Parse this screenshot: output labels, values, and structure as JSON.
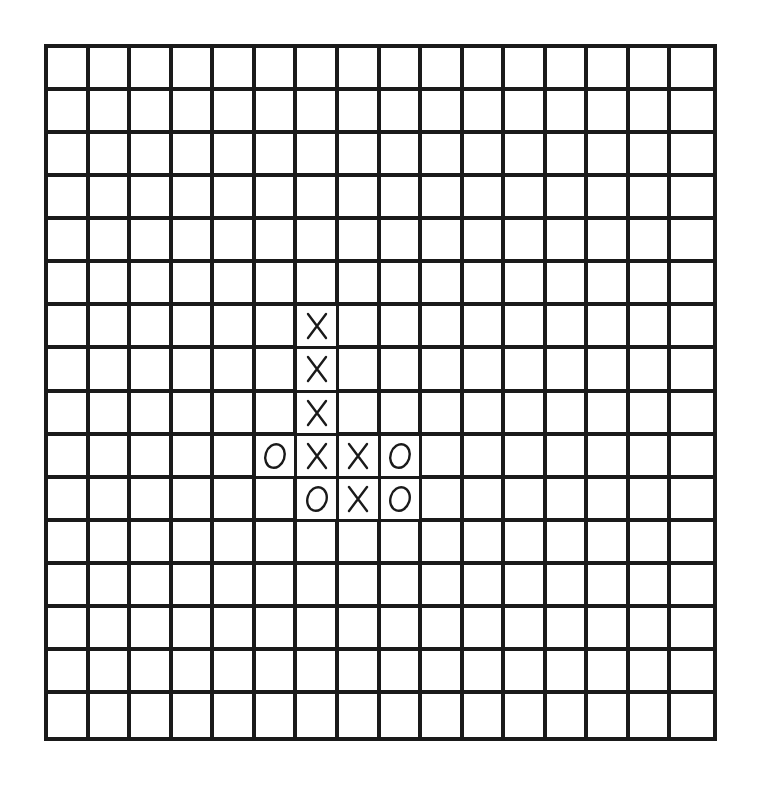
{
  "game": {
    "type": "gomoku-style grid game",
    "rows": 16,
    "cols": 16,
    "line_color": "#1a1a1a",
    "background": "#ffffff",
    "marks": [
      {
        "row": 6,
        "col": 6,
        "symbol": "X"
      },
      {
        "row": 7,
        "col": 6,
        "symbol": "X"
      },
      {
        "row": 8,
        "col": 6,
        "symbol": "X"
      },
      {
        "row": 9,
        "col": 5,
        "symbol": "O"
      },
      {
        "row": 9,
        "col": 6,
        "symbol": "X"
      },
      {
        "row": 9,
        "col": 7,
        "symbol": "X"
      },
      {
        "row": 9,
        "col": 8,
        "symbol": "O"
      },
      {
        "row": 10,
        "col": 6,
        "symbol": "O"
      },
      {
        "row": 10,
        "col": 7,
        "symbol": "X"
      },
      {
        "row": 10,
        "col": 8,
        "symbol": "O"
      }
    ],
    "icons": {
      "X": "x-mark-icon",
      "O": "o-mark-icon"
    }
  }
}
